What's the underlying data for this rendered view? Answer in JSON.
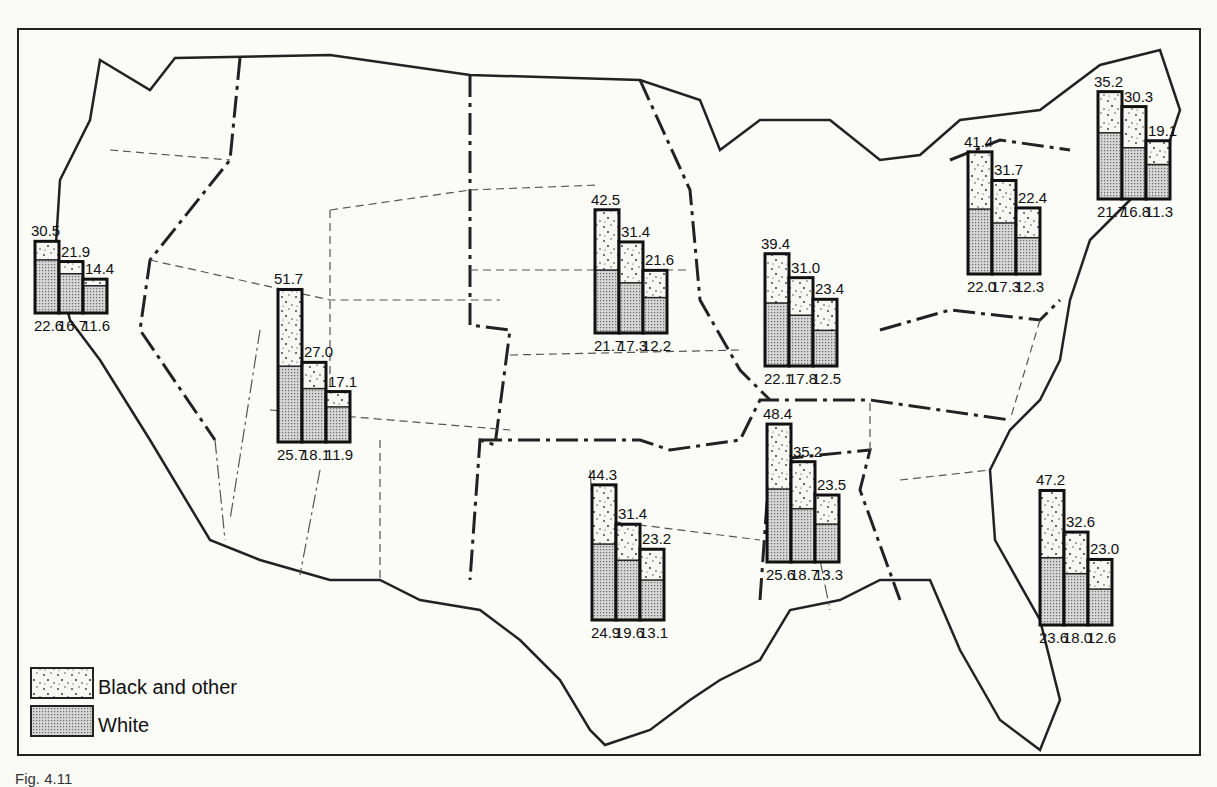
{
  "legend": {
    "items": [
      {
        "label": "Black and other",
        "pattern": "speckled"
      },
      {
        "label": "White",
        "pattern": "fine-dot"
      }
    ]
  },
  "caption": {
    "text": "Fig. 4.11"
  },
  "chart_data": {
    "type": "bar",
    "title": "",
    "series": [
      "Black and other",
      "White"
    ],
    "regions": [
      {
        "name": "Pacific",
        "top_values": [
          30.5,
          21.9,
          14.4
        ],
        "white_values": [
          22.6,
          16.7,
          11.6
        ]
      },
      {
        "name": "Mountain",
        "top_values": [
          51.7,
          27.0,
          17.1
        ],
        "white_values": [
          25.7,
          18.1,
          11.9
        ]
      },
      {
        "name": "West North Central",
        "top_values": [
          42.5,
          31.4,
          21.6
        ],
        "white_values": [
          21.7,
          17.3,
          12.2
        ]
      },
      {
        "name": "East North Central",
        "top_values": [
          39.4,
          31.0,
          23.4
        ],
        "white_values": [
          22.1,
          17.8,
          12.5
        ]
      },
      {
        "name": "Middle Atlantic",
        "top_values": [
          41.4,
          31.7,
          22.4
        ],
        "white_values": [
          22.0,
          17.3,
          12.3
        ]
      },
      {
        "name": "New England",
        "top_values": [
          35.2,
          30.3,
          19.1
        ],
        "white_values": [
          21.7,
          16.8,
          11.3
        ]
      },
      {
        "name": "West South Central",
        "top_values": [
          44.3,
          31.4,
          23.2
        ],
        "white_values": [
          24.9,
          19.6,
          13.1
        ]
      },
      {
        "name": "East South Central",
        "top_values": [
          48.4,
          35.2,
          23.5
        ],
        "white_values": [
          25.6,
          18.7,
          13.3
        ]
      },
      {
        "name": "South Atlantic",
        "top_values": [
          47.2,
          32.6,
          23.0
        ],
        "white_values": [
          23.6,
          18.0,
          12.6
        ]
      }
    ]
  },
  "layout": {
    "groups": [
      {
        "x": 35,
        "base": 313,
        "scale": 2.35
      },
      {
        "x": 278,
        "base": 442,
        "scale": 2.95
      },
      {
        "x": 595,
        "base": 333,
        "scale": 2.9
      },
      {
        "x": 765,
        "base": 366,
        "scale": 2.85
      },
      {
        "x": 968,
        "base": 274,
        "scale": 2.95
      },
      {
        "x": 1098,
        "base": 199,
        "scale": 3.05
      },
      {
        "x": 592,
        "base": 620,
        "scale": 3.05
      },
      {
        "x": 767,
        "base": 562,
        "scale": 2.85
      },
      {
        "x": 1040,
        "base": 625,
        "scale": 2.85
      }
    ]
  }
}
